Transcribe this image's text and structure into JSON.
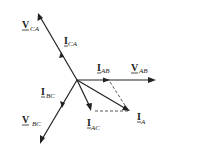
{
  "diagram": {
    "type": "phasor-diagram",
    "phasors": [
      {
        "id": "V_CA",
        "main": "V",
        "sub": "CA",
        "kind": "voltage"
      },
      {
        "id": "I_CA",
        "main": "I",
        "sub": "CA",
        "kind": "current"
      },
      {
        "id": "I_AB",
        "main": "I",
        "sub": "AB",
        "kind": "current"
      },
      {
        "id": "V_AB",
        "main": "V",
        "sub": "AB",
        "kind": "voltage"
      },
      {
        "id": "I_BC",
        "main": "I",
        "sub": "BC",
        "kind": "current"
      },
      {
        "id": "V_BC",
        "main": "V",
        "sub": "BC",
        "kind": "voltage"
      },
      {
        "id": "I_AC",
        "main": "I",
        "sub": "AC",
        "kind": "current"
      },
      {
        "id": "I_A",
        "main": "I",
        "sub": "A",
        "kind": "current"
      }
    ]
  }
}
